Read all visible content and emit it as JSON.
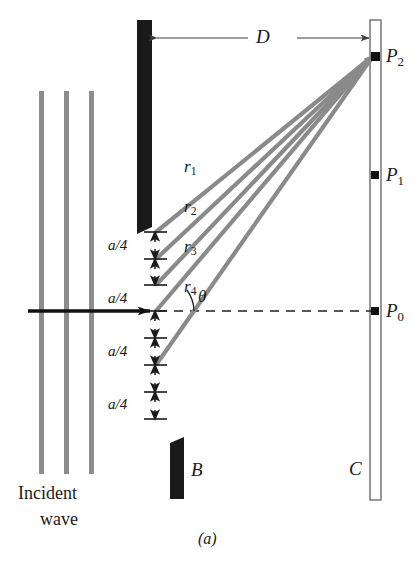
{
  "figure": {
    "caption": "(a)",
    "title_alt": "Single-slit diffraction: four rays from slit to screen",
    "colors": {
      "wavefront_gray": "#8c8c8c",
      "ray_gray": "#8a8a8a",
      "barrier_black": "#1a1a1a",
      "screen_outline": "#6b6b6b",
      "point_black": "#111111",
      "dashed_axis": "#222222",
      "dimension_line": "#4a4a4a",
      "background": "#ffffff"
    }
  },
  "labels": {
    "distance": "D",
    "angle": "θ",
    "barrier_lower": "B",
    "screen": "C",
    "incident_wave_line1": "Incident",
    "incident_wave_line2": "wave"
  },
  "rays": [
    {
      "name": "r",
      "index": "1",
      "label": "r₁"
    },
    {
      "name": "r",
      "index": "2",
      "label": "r₂"
    },
    {
      "name": "r",
      "index": "3",
      "label": "r₃"
    },
    {
      "name": "r",
      "index": "4",
      "label": "r₄"
    }
  ],
  "screen_points": [
    {
      "name": "P",
      "index": "2",
      "label": "P₂"
    },
    {
      "name": "P",
      "index": "1",
      "label": "P₁"
    },
    {
      "name": "P",
      "index": "0",
      "label": "P₀"
    }
  ],
  "slit_divisions": [
    {
      "label": "a/4",
      "numerator": "a",
      "denominator": "4"
    },
    {
      "label": "a/4",
      "numerator": "a",
      "denominator": "4"
    },
    {
      "label": "a/4",
      "numerator": "a",
      "denominator": "4"
    },
    {
      "label": "a/4",
      "numerator": "a",
      "denominator": "4"
    }
  ],
  "geometry": {
    "slit_width_label": "a",
    "segment_count": 4,
    "distance_to_screen_label": "D",
    "note": "Slit of width a divided into four a/4 strips; rays r1..r4 leave at angle theta and meet at P2 on screen C a distance D away."
  }
}
